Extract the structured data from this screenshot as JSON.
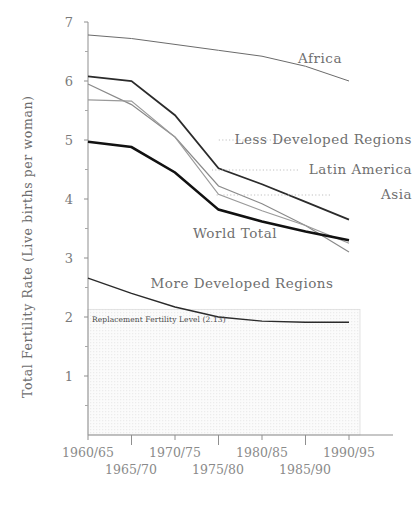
{
  "chart_data": {
    "type": "line",
    "title": "",
    "subtitle": "",
    "xlabel": "",
    "ylabel": "Total Fertility Rate (Live births per woman)",
    "categories": [
      "1960/65",
      "1965/70",
      "1970/75",
      "1975/80",
      "1980/85",
      "1985/90",
      "1990/95"
    ],
    "xtick_labels_row1": [
      "1960/65",
      "1970/75",
      "1980/85",
      "1990/95"
    ],
    "xtick_labels_row2": [
      "1965/70",
      "1975/80",
      "1985/90"
    ],
    "ylim": [
      0,
      7
    ],
    "yticks": [
      1,
      2,
      3,
      4,
      5,
      6,
      7
    ],
    "ytick_labels": [
      "1",
      "2",
      "3",
      "4",
      "5",
      "6",
      "7"
    ],
    "grid": false,
    "legend_position": "inline-annotations",
    "series": [
      {
        "name": "Africa",
        "label": "Africa",
        "color": "#6b6b6b",
        "width": 1.0,
        "values": [
          6.78,
          6.72,
          6.62,
          6.52,
          6.42,
          6.25,
          6.0
        ]
      },
      {
        "name": "Less Developed Regions",
        "label": "Less Developed Regions",
        "color": "#2b2b2b",
        "width": 1.8,
        "values": [
          6.08,
          6.0,
          5.42,
          4.52,
          4.25,
          3.95,
          3.65
        ]
      },
      {
        "name": "Latin America",
        "label": "Latin America",
        "color": "#8a8a8a",
        "width": 1.2,
        "values": [
          5.95,
          5.6,
          5.05,
          4.22,
          3.92,
          3.55,
          3.1
        ]
      },
      {
        "name": "Asia",
        "label": "Asia",
        "color": "#9a9a9a",
        "width": 1.2,
        "values": [
          5.68,
          5.66,
          5.05,
          4.08,
          3.8,
          3.55,
          3.25
        ]
      },
      {
        "name": "World Total",
        "label": "World Total",
        "color": "#111111",
        "width": 2.6,
        "values": [
          4.97,
          4.88,
          4.45,
          3.82,
          3.62,
          3.45,
          3.3
        ]
      },
      {
        "name": "More Developed Regions",
        "label": "More Developed Regions",
        "color": "#2b2b2b",
        "width": 1.4,
        "values": [
          2.66,
          2.4,
          2.17,
          2.0,
          1.93,
          1.91,
          1.91
        ]
      }
    ],
    "annotations": [
      {
        "name": "replacement-fertility-level",
        "text": "Replacement Fertility Level (2.13)",
        "value": 2.13,
        "shaded_region": {
          "from": 0,
          "to": 2.13,
          "fill": "#f2f2f2",
          "pattern": "dotted"
        }
      }
    ]
  },
  "labels": {
    "africa": "Africa",
    "less_developed": "Less Developed Regions",
    "latin_america": "Latin America",
    "asia": "Asia",
    "world_total": "World Total",
    "more_developed": "More Developed Regions",
    "replacement": "Replacement Fertility Level (2.13)"
  },
  "axis": {
    "y_title": "Total Fertility Rate (Live births per woman)",
    "y1": "1",
    "y2": "2",
    "y3": "3",
    "y4": "4",
    "y5": "5",
    "y6": "6",
    "y7": "7",
    "x0": "1960/65",
    "x1": "1965/70",
    "x2": "1970/75",
    "x3": "1975/80",
    "x4": "1980/85",
    "x5": "1985/90",
    "x6": "1990/95"
  },
  "colors": {
    "axis": "#8f8f8f",
    "text": "#6f6f6f",
    "shade": "#f2f2f2",
    "world_total": "#111111",
    "africa": "#6b6b6b"
  }
}
